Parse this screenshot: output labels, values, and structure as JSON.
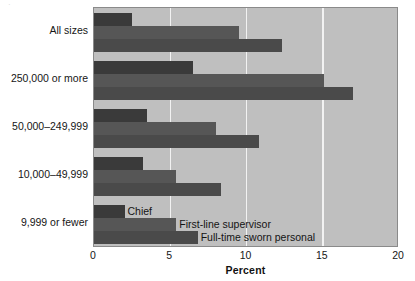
{
  "chart_data": {
    "type": "bar",
    "orientation": "horizontal",
    "title": "",
    "subtitle": "",
    "xlabel": "Percent",
    "ylabel": "",
    "xlim": [
      0,
      20
    ],
    "xticks": [
      0,
      5,
      10,
      15,
      20
    ],
    "xtick_labels": [
      "0",
      "5",
      "10",
      "15",
      "20"
    ],
    "grid": true,
    "grid_axis": "x",
    "legend_position": "inside-bottom-left",
    "categories": [
      "All sizes",
      "250,000 or more",
      "50,000–249,999",
      "10,000–49,999",
      "9,999 or fewer"
    ],
    "series": [
      {
        "name": "Chief",
        "color": "#3a3a3a",
        "values": [
          2.5,
          6.5,
          3.5,
          3.2,
          2.0
        ]
      },
      {
        "name": "First-line supervisor",
        "color": "#565656",
        "values": [
          9.5,
          15.1,
          8.0,
          5.4,
          5.4
        ]
      },
      {
        "name": "Full-time sworn personal",
        "color": "#4a4a4a",
        "values": [
          12.3,
          17.0,
          10.8,
          8.3,
          6.8
        ]
      }
    ]
  },
  "legend_notes": [
    {
      "label": "Chief"
    },
    {
      "label": "First-line supervisor"
    },
    {
      "label": "Full-time sworn personal"
    }
  ],
  "artifact": {
    "glyph": "·"
  },
  "colors": {
    "plot_background": "#bfbfbf",
    "gridline": "#f2f2f2",
    "plot_border": "#8a8a8a",
    "page_background": "#ffffff",
    "text": "#161616"
  }
}
